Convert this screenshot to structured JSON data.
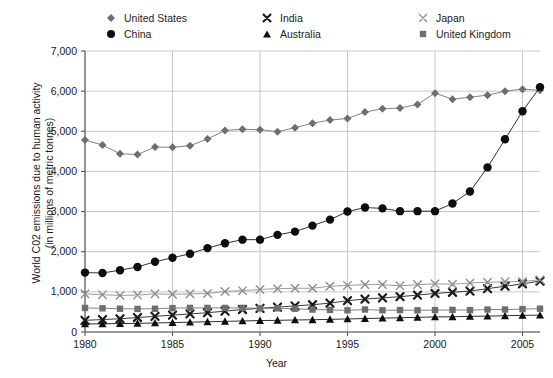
{
  "chart_data": {
    "type": "line",
    "title": "",
    "xlabel": "Year",
    "ylabel": "World C02 emissions due to human activity (in millions of metric tonnes)",
    "ylabel_line1": "World C02 emissions due to human activity",
    "ylabel_line2": "(in millions of metric tonnes)",
    "xlim": [
      1980,
      2006
    ],
    "ylim": [
      0,
      7000
    ],
    "ytick_step": 1000,
    "xtick_step": 5,
    "grid": true,
    "legend_position": "top",
    "yticks": [
      "0",
      "1,000",
      "2,000",
      "3,000",
      "4,000",
      "5,000",
      "6,000",
      "7,000"
    ],
    "ytick_values": [
      0,
      1000,
      2000,
      3000,
      4000,
      5000,
      6000,
      7000
    ],
    "xticks": [
      "1980",
      "1985",
      "1990",
      "1995",
      "2000",
      "2005"
    ],
    "xtick_values": [
      1980,
      1985,
      1990,
      1995,
      2000,
      2005
    ],
    "x": [
      1980,
      1981,
      1982,
      1983,
      1984,
      1985,
      1986,
      1987,
      1988,
      1989,
      1990,
      1991,
      1992,
      1993,
      1994,
      1995,
      1996,
      1997,
      1998,
      1999,
      2000,
      2001,
      2002,
      2003,
      2004,
      2005,
      2006
    ],
    "series": [
      {
        "name": "United States",
        "marker": "diamond",
        "color": "#6e6e6e",
        "values": [
          4780,
          4660,
          4440,
          4420,
          4610,
          4600,
          4640,
          4810,
          5020,
          5050,
          5040,
          4990,
          5090,
          5200,
          5280,
          5320,
          5480,
          5560,
          5580,
          5670,
          5950,
          5800,
          5850,
          5900,
          6000,
          6050,
          6020
        ]
      },
      {
        "name": "China",
        "marker": "circle",
        "color": "#0d0d0d",
        "values": [
          1480,
          1470,
          1540,
          1620,
          1750,
          1850,
          1950,
          2090,
          2210,
          2300,
          2300,
          2420,
          2500,
          2650,
          2800,
          3000,
          3100,
          3080,
          3010,
          3010,
          3010,
          3200,
          3500,
          4100,
          4800,
          5500,
          6100
        ]
      },
      {
        "name": "India",
        "marker": "x-bold",
        "color": "#1a1a1a",
        "values": [
          290,
          310,
          330,
          360,
          390,
          420,
          450,
          480,
          520,
          560,
          590,
          620,
          650,
          680,
          720,
          780,
          820,
          850,
          880,
          920,
          960,
          990,
          1020,
          1080,
          1140,
          1200,
          1270
        ]
      },
      {
        "name": "Australia",
        "marker": "triangle",
        "color": "#0d0d0d",
        "values": [
          200,
          205,
          210,
          215,
          225,
          235,
          245,
          255,
          265,
          275,
          285,
          290,
          300,
          305,
          315,
          325,
          335,
          345,
          355,
          365,
          375,
          380,
          390,
          395,
          405,
          415,
          420
        ]
      },
      {
        "name": "Japan",
        "marker": "x-thin",
        "color": "#8c8c8c",
        "values": [
          950,
          930,
          910,
          920,
          950,
          940,
          950,
          960,
          1010,
          1030,
          1060,
          1080,
          1090,
          1090,
          1140,
          1160,
          1180,
          1180,
          1150,
          1180,
          1200,
          1190,
          1220,
          1240,
          1250,
          1260,
          1300
        ]
      },
      {
        "name": "United Kingdom",
        "marker": "square",
        "color": "#6e6e6e",
        "values": [
          600,
          590,
          580,
          575,
          580,
          595,
          600,
          600,
          600,
          600,
          590,
          590,
          580,
          560,
          550,
          540,
          560,
          540,
          545,
          540,
          545,
          550,
          545,
          560,
          560,
          570,
          580
        ]
      }
    ]
  },
  "legend": {
    "columns": [
      [
        {
          "label": "United States",
          "marker": "diamond",
          "color": "#6e6e6e"
        },
        {
          "label": "China",
          "marker": "circle",
          "color": "#0d0d0d"
        }
      ],
      [
        {
          "label": "India",
          "marker": "x-bold",
          "color": "#1a1a1a"
        },
        {
          "label": "Australia",
          "marker": "triangle",
          "color": "#0d0d0d"
        }
      ],
      [
        {
          "label": "Japan",
          "marker": "x-thin",
          "color": "#8c8c8c"
        },
        {
          "label": "United Kingdom",
          "marker": "square",
          "color": "#6e6e6e"
        }
      ]
    ]
  }
}
